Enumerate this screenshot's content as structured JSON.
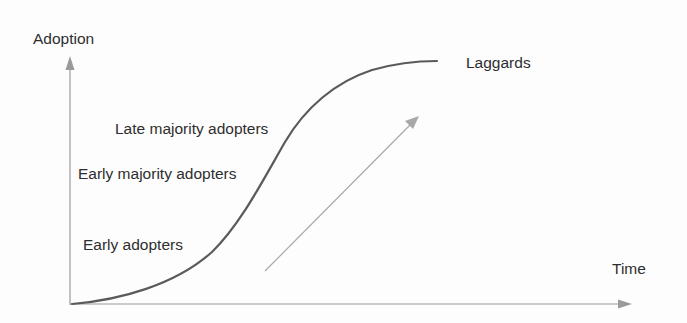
{
  "diagram": {
    "type": "technology-adoption-s-curve",
    "axes": {
      "y_label": "Adoption",
      "x_label": "Time"
    },
    "stages": [
      {
        "label": "Early adopters"
      },
      {
        "label": "Early majority adopters"
      },
      {
        "label": "Late majority adopters"
      },
      {
        "label": "Laggards"
      }
    ],
    "colors": {
      "curve": "#5a5a5a",
      "axis": "#9a9a9a",
      "arrow": "#a8a8a8",
      "text": "#2e2e2e"
    }
  }
}
